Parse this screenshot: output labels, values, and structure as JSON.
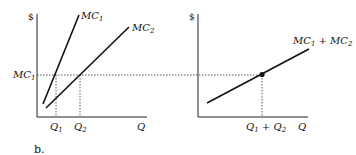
{
  "diagram": {
    "caption": "b.",
    "left_panel": {
      "y_axis_label": "$",
      "x_axis_label": "Q",
      "curves": [
        {
          "name": "MC",
          "sub": "1"
        },
        {
          "name": "MC",
          "sub": "2"
        }
      ],
      "price_level_label": {
        "name": "MC",
        "sub": "1"
      },
      "x_ticks": [
        {
          "name": "Q",
          "sub": "1"
        },
        {
          "name": "Q",
          "sub": "2"
        }
      ]
    },
    "right_panel": {
      "y_axis_label": "$",
      "x_axis_label": "Q",
      "curve": {
        "a": "MC",
        "a_sub": "1",
        "op": " + ",
        "b": "MC",
        "b_sub": "2"
      },
      "x_tick": {
        "a": "Q",
        "a_sub": "1",
        "op": " + ",
        "b": "Q",
        "b_sub": "2"
      }
    }
  }
}
